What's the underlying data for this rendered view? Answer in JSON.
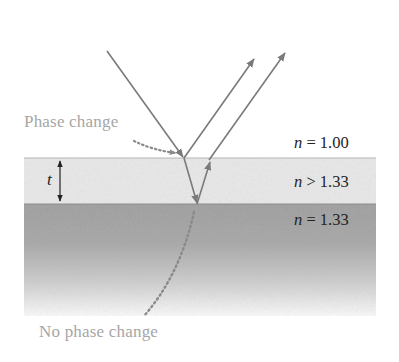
{
  "diagram": {
    "media": [
      {
        "name": "air",
        "index_var": "n",
        "relation": "=",
        "value": "1.00",
        "color": "#ffffff"
      },
      {
        "name": "film",
        "index_var": "n",
        "relation": ">",
        "value": "1.33",
        "color": "#ececec"
      },
      {
        "name": "water",
        "index_var": "n",
        "relation": "=",
        "value": "1.33",
        "color": "#9c9c9c"
      }
    ],
    "labels": {
      "phase_change": "Phase change",
      "no_phase_change": "No phase change",
      "thickness": "t",
      "air_index_var": "n",
      "air_index_rest": " = 1.00",
      "film_index_var": "n",
      "film_index_rest": " > 1.33",
      "water_index_var": "n",
      "water_index_rest": " = 1.33"
    },
    "rays": {
      "incident": "incoming ray from upper left striking top surface",
      "reflected_top": "ray reflected at air–film surface (with phase change)",
      "refracted_in_film": "ray transmitted into film, reflected at film–water surface",
      "reflected_bottom": "ray re-emerging from film into air (no phase change)"
    },
    "colors": {
      "ray": "#7a7a7a",
      "callout_text": "#a6a6a6",
      "dotted_pointer": "#8a8a8a",
      "film_fill": "#ececec",
      "water_fill_top": "#9a9a9a",
      "water_fill_bottom": "#ffffff",
      "boundary_line": "#b5b5b5",
      "dimension_arrow": "#222222"
    }
  }
}
